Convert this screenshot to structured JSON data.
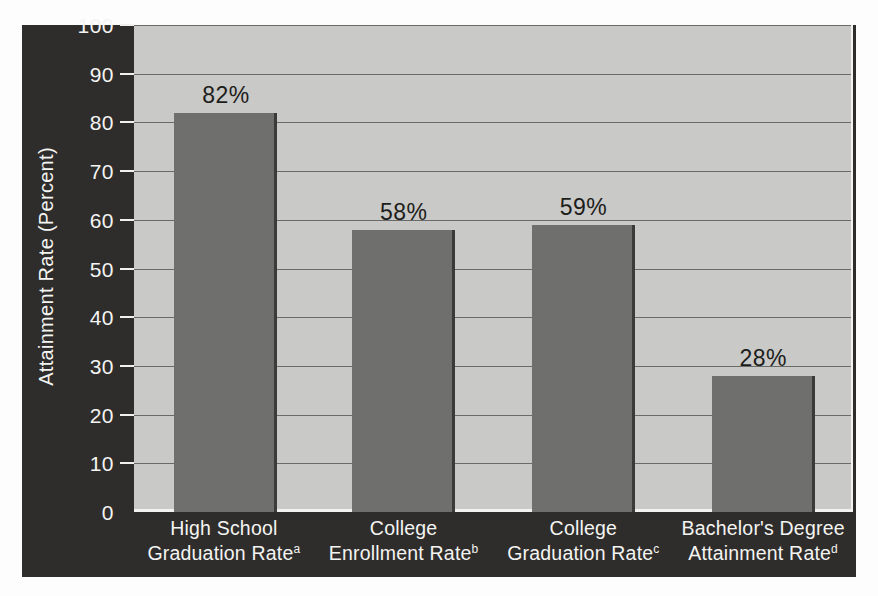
{
  "chart_data": {
    "type": "bar",
    "title": "",
    "xlabel": "",
    "ylabel": "Attainment Rate (Percent)",
    "ylim": [
      0,
      100
    ],
    "ytick_values": [
      0,
      10,
      20,
      30,
      40,
      50,
      60,
      70,
      80,
      90,
      100
    ],
    "ytick_labels": [
      "0",
      "10",
      "20",
      "30",
      "40",
      "50",
      "60",
      "70",
      "80",
      "90",
      "100"
    ],
    "grid": true,
    "legend": false,
    "categories": [
      "High School Graduation Rate",
      "College Enrollment Rate",
      "College Graduation Rate",
      "Bachelor's Degree Attainment Rate"
    ],
    "category_lines": [
      {
        "line1": "High School",
        "line2": "Graduation Rate",
        "footnote": "a"
      },
      {
        "line1": "College",
        "line2": "Enrollment Rate",
        "footnote": "b"
      },
      {
        "line1": "College",
        "line2": "Graduation Rate",
        "footnote": "c"
      },
      {
        "line1": "Bachelor's Degree",
        "line2": "Attainment Rate",
        "footnote": "d"
      }
    ],
    "values": [
      82,
      58,
      59,
      28
    ],
    "data_labels": [
      "82%",
      "58%",
      "59%",
      "28%"
    ],
    "colors": {
      "bar_fill": "#6f6f6d",
      "bar_edge": "#3b3b39",
      "plot_background": "#c9c9c7",
      "panel_background": "#2e2d2b",
      "gridline": "#6a6a68",
      "axis_text": "#f4f4f2",
      "label_text": "#1d1d1b"
    }
  }
}
